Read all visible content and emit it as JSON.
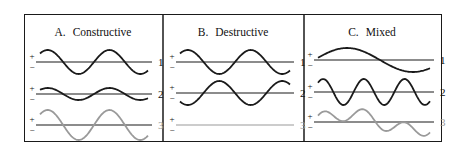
{
  "figure": {
    "frame": {
      "x": 24,
      "y": 14,
      "width": 418,
      "height": 128
    },
    "dividers_x": [
      163,
      304
    ],
    "colors": {
      "dark": "#1a1a1a",
      "gray": "#9a9a9a",
      "axis": "#1a1a1a"
    },
    "panels": [
      {
        "id": "A",
        "letter": "A.",
        "title": "Constructive",
        "title_center_x": 93,
        "x_start": 40,
        "x_end": 148,
        "rows": [
          {
            "label": "1",
            "baseline": 62,
            "amplitude": 12,
            "cycles": 1.75,
            "phase": 0,
            "color": "dark",
            "components": null
          },
          {
            "label": "2",
            "baseline": 94,
            "amplitude": 6,
            "cycles": 1.75,
            "phase": 0,
            "color": "dark",
            "components": null
          },
          {
            "label": "3",
            "baseline": 125,
            "amplitude": 15,
            "cycles": 1.75,
            "phase": 0,
            "color": "gray",
            "components": null
          }
        ]
      },
      {
        "id": "B",
        "letter": "B.",
        "title": "Destructive",
        "title_center_x": 233,
        "x_start": 180,
        "x_end": 290,
        "rows": [
          {
            "label": "1",
            "baseline": 62,
            "amplitude": 12,
            "cycles": 1.75,
            "phase": 0,
            "color": "dark",
            "components": null
          },
          {
            "label": "2",
            "baseline": 93,
            "amplitude": 12,
            "cycles": 1.75,
            "phase": 3.14159,
            "color": "dark",
            "components": null
          },
          {
            "label": "3",
            "baseline": 125,
            "amplitude": 0,
            "cycles": 1.75,
            "phase": 0,
            "color": "gray",
            "components": null
          }
        ]
      },
      {
        "id": "C",
        "letter": "C.",
        "title": "Mixed",
        "title_center_x": 372,
        "x_start": 318,
        "x_end": 430,
        "rows": [
          {
            "label": "1",
            "baseline": 60,
            "amplitude": 12,
            "cycles": 0.85,
            "phase": -0.6,
            "color": "dark",
            "components": null
          },
          {
            "label": "2",
            "baseline": 92,
            "amplitude": 13,
            "cycles": 2.75,
            "phase": 0,
            "color": "dark",
            "components": null
          },
          {
            "label": "3",
            "baseline": 122,
            "amplitude": 0,
            "cycles": 1,
            "phase": 0,
            "color": "gray",
            "components": [
              {
                "amplitude": 8,
                "cycles": 0.85,
                "phase": -0.6
              },
              {
                "amplitude": 7,
                "cycles": 2.75,
                "phase": 0
              }
            ]
          }
        ]
      }
    ],
    "sign_labels": {
      "plus": "+",
      "minus": "−"
    }
  }
}
